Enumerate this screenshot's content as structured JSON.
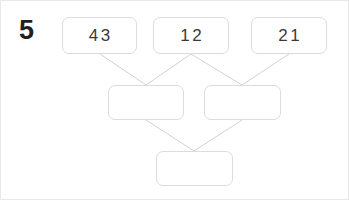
{
  "question": {
    "number": "5"
  },
  "colors": {
    "frame_border": "#e9e9e9",
    "cell_border": "#dcdcdc",
    "connector_line": "#d2d2d2",
    "number_text": "#231f20",
    "cell_text": "#3a3a3a",
    "background": "#ffffff"
  },
  "pyramid": {
    "type": "addition-pyramid",
    "rows": [
      {
        "row_index": 0,
        "cells": [
          {
            "id": "top-1",
            "value": "43",
            "filled": true
          },
          {
            "id": "top-2",
            "value": "12",
            "filled": true
          },
          {
            "id": "top-3",
            "value": "21",
            "filled": true
          }
        ]
      },
      {
        "row_index": 1,
        "cells": [
          {
            "id": "mid-1",
            "value": "",
            "filled": false
          },
          {
            "id": "mid-2",
            "value": "",
            "filled": false
          }
        ]
      },
      {
        "row_index": 2,
        "cells": [
          {
            "id": "bot-1",
            "value": "",
            "filled": false
          }
        ]
      }
    ],
    "connectors": [
      {
        "from": "top-1",
        "to": "mid-1"
      },
      {
        "from": "top-2",
        "to": "mid-1"
      },
      {
        "from": "top-2",
        "to": "mid-2"
      },
      {
        "from": "top-3",
        "to": "mid-2"
      },
      {
        "from": "mid-1",
        "to": "bot-1"
      },
      {
        "from": "mid-2",
        "to": "bot-1"
      }
    ]
  }
}
